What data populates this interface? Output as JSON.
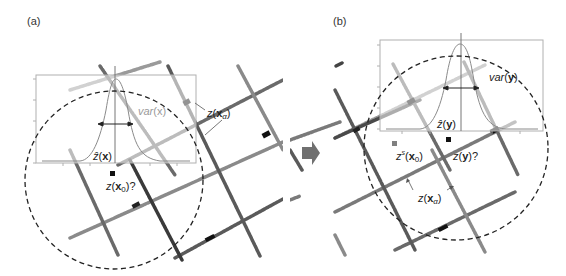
{
  "panels": [
    {
      "id": "a",
      "label": "(a)",
      "annotations": {
        "variance_label": "var(x)",
        "estimate_label": "ẑ(x)",
        "target_label": "z(x0)?",
        "sample_label": "z(xα)"
      }
    },
    {
      "id": "b",
      "label": "(b)",
      "annotations": {
        "variance_label": "var(y)",
        "estimate_label": "ẑ(y)",
        "simulated_label": "zs(x0)",
        "target_label": "z(y)?",
        "sample_label": "z(xα)"
      }
    }
  ],
  "transition_arrow": "right-arrow",
  "colors": {
    "dashed_circle": "#222222",
    "box_border": "#b0b0b0",
    "curve": "#8a8a8a",
    "arrow": "#707070",
    "target_marker": "#111111",
    "simulated_marker": "#808080"
  }
}
